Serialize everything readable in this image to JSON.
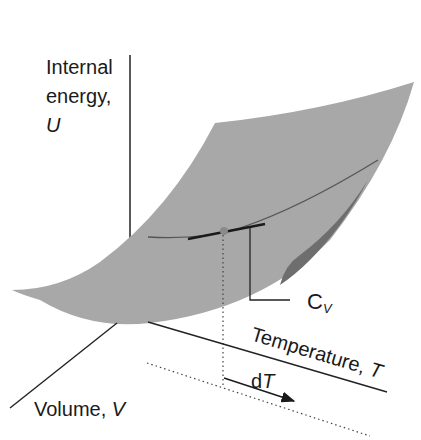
{
  "diagram": {
    "axes": {
      "u": {
        "line1": "Internal",
        "line2": "energy,",
        "symbol": "U"
      },
      "volume": {
        "text": "Volume, ",
        "symbol": "V"
      },
      "temperature": {
        "text": "Temperature, ",
        "symbol": "T"
      }
    },
    "annotations": {
      "cv": {
        "main": "C",
        "sub": "V"
      },
      "dt": {
        "d": "d",
        "symbol": "T"
      }
    },
    "colors": {
      "surface": "#a8a8a8",
      "surface_edge": "#b4b4b4",
      "underside": "#6e6e6e",
      "curve": "#555555",
      "tangent": "#1a1a1a",
      "point": "#8a8a8a",
      "axis": "#222222"
    }
  }
}
